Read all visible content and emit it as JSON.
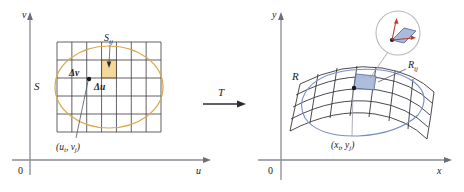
{
  "figure": {
    "type": "math-diagram",
    "panels": [
      {
        "id": "uv-plane",
        "axes": {
          "x_label": "u",
          "y_label": "v",
          "origin_label": "0"
        },
        "labels": {
          "region": "S",
          "subregion": "S",
          "subregion_sub": "ij",
          "delta_u": "Δu",
          "delta_v": "Δv",
          "point": "(u",
          "point_sub1": "i",
          "point_mid": ", v",
          "point_sub2": "j",
          "point_end": ")"
        },
        "grid": {
          "columns": 7,
          "rows": 5,
          "highlighted_cell": {
            "col": 3,
            "row": 1
          }
        }
      },
      {
        "id": "transform-arrow",
        "label": "T"
      },
      {
        "id": "xy-plane",
        "axes": {
          "x_label": "x",
          "y_label": "y",
          "origin_label": "0"
        },
        "labels": {
          "region": "R",
          "subregion": "R",
          "subregion_sub": "ij",
          "point": "(x",
          "point_sub1": "i",
          "point_mid": ", y",
          "point_sub2": "j",
          "point_end": ")"
        },
        "inset": {
          "kind": "magnifier-circle",
          "content": "tangent parallelogram with vectors"
        }
      }
    ]
  },
  "colors": {
    "axis": "#8a8a93",
    "grid": "#3a3a44",
    "ellipse": "#d8a94a",
    "highlight_fill": "#f6d99a",
    "highlight_stroke": "#c99a3c",
    "surface_mesh": "#2b2b33",
    "surface_blue": "#7b8fc4",
    "patch_fill": "#aabada",
    "patch_stroke": "#5c6fa5",
    "inset_circle": "#b8b8c0",
    "vector_red": "#c0392b",
    "text": "#1a1a22"
  }
}
